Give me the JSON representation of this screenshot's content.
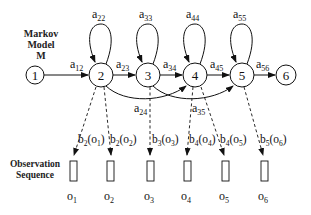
{
  "model_label": {
    "line1": "Markov",
    "line2": "Model",
    "line3": "M"
  },
  "observation_label": {
    "line1": "Observation",
    "line2": "Sequence"
  },
  "states": [
    {
      "id": "1",
      "x": 35,
      "y": 75,
      "r": 9
    },
    {
      "id": "2",
      "x": 101,
      "y": 75,
      "r": 12
    },
    {
      "id": "3",
      "x": 148,
      "y": 75,
      "r": 12
    },
    {
      "id": "4",
      "x": 195,
      "y": 75,
      "r": 12
    },
    {
      "id": "5",
      "x": 242,
      "y": 75,
      "r": 12
    },
    {
      "id": "6",
      "x": 286,
      "y": 75,
      "r": 10
    }
  ],
  "transitions": {
    "a12": {
      "a": "a",
      "sub": "12"
    },
    "a23": {
      "a": "a",
      "sub": "23"
    },
    "a34": {
      "a": "a",
      "sub": "34"
    },
    "a45": {
      "a": "a",
      "sub": "45"
    },
    "a56": {
      "a": "a",
      "sub": "56"
    },
    "a22": {
      "a": "a",
      "sub": "22"
    },
    "a33": {
      "a": "a",
      "sub": "33"
    },
    "a44": {
      "a": "a",
      "sub": "44"
    },
    "a55": {
      "a": "a",
      "sub": "55"
    },
    "a24": {
      "a": "a",
      "sub": "24"
    },
    "a35": {
      "a": "a",
      "sub": "35"
    }
  },
  "emissions": [
    {
      "b": "b",
      "bsub": "2",
      "o": "o",
      "osub": "1"
    },
    {
      "b": "b",
      "bsub": "2",
      "o": "o",
      "osub": "2"
    },
    {
      "b": "b",
      "bsub": "3",
      "o": "o",
      "osub": "3"
    },
    {
      "b": "b",
      "bsub": "4",
      "o": "o",
      "osub": "4"
    },
    {
      "b": "b",
      "bsub": "4",
      "o": "o",
      "osub": "5"
    },
    {
      "b": "b",
      "bsub": "5",
      "o": "o",
      "osub": "6"
    }
  ],
  "observations": [
    {
      "o": "o",
      "sub": "1"
    },
    {
      "o": "o",
      "sub": "2"
    },
    {
      "o": "o",
      "sub": "3"
    },
    {
      "o": "o",
      "sub": "4"
    },
    {
      "o": "o",
      "sub": "5"
    },
    {
      "o": "o",
      "sub": "6"
    }
  ]
}
